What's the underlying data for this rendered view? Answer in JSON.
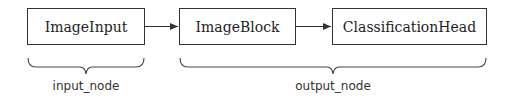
{
  "nodes": [
    {
      "id": "image-input",
      "label": "ImageInput"
    },
    {
      "id": "image-block",
      "label": "ImageBlock"
    },
    {
      "id": "classification-head",
      "label": "ClassificationHead"
    }
  ],
  "edges": [
    {
      "from": "ImageInput",
      "to": "ImageBlock"
    },
    {
      "from": "ImageBlock",
      "to": "ClassificationHead"
    }
  ],
  "groups": [
    {
      "label": "input_node",
      "members": [
        "ImageInput"
      ]
    },
    {
      "label": "output_node",
      "members": [
        "ImageBlock",
        "ClassificationHead"
      ]
    }
  ]
}
